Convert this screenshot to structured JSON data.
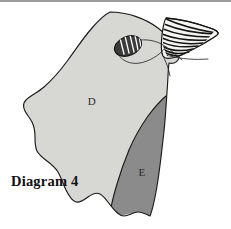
{
  "figure": {
    "caption": "Diagram 4",
    "background_color": "#ffffff",
    "outline_color": "#1b1b1b",
    "width": 231,
    "height": 229
  },
  "regions": [
    {
      "id": "D",
      "label": "D",
      "fill_color": "#d7d7d3",
      "description": "large light grey region occupying the upper and left portion of the specimen"
    },
    {
      "id": "E",
      "label": "E",
      "fill_color": "#8b8b8b",
      "description": "darker grey region occupying the lower right portion of the specimen"
    }
  ],
  "structures": [
    {
      "id": "hatched-fan",
      "name": "hatched fan structure",
      "label": "",
      "fill_color": "#f2f2ee",
      "stripe_color": "#141414",
      "stripe_count": 11,
      "description": "triangular fanned structure with radiating curved hatch lines at the upper right apex"
    },
    {
      "id": "striped-oval",
      "name": "striped oval body",
      "label": "",
      "fill_color": "#3a3a3a",
      "stripe_color": "#ffffff",
      "stripe_count": 5,
      "description": "small dark oval with white striations attached to a curved stalk in the upper middle"
    },
    {
      "id": "stalk",
      "name": "curved stalk",
      "label": "",
      "description": "thin curved line connecting the striped oval to the right side of the specimen"
    },
    {
      "id": "whisker",
      "name": "trailing filament",
      "label": "",
      "description": "thin line trailing off to the right below the hatched fan"
    }
  ],
  "labels": {
    "region_d": "D",
    "region_e": "E",
    "caption": "Diagram 4"
  }
}
